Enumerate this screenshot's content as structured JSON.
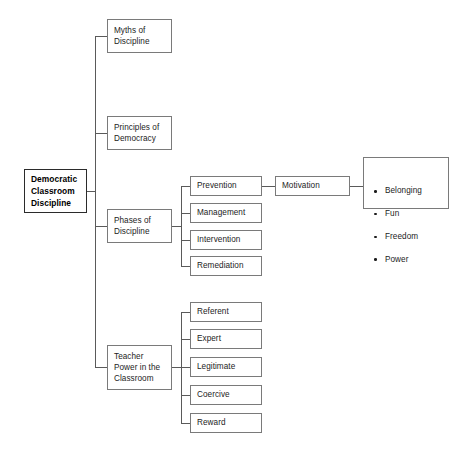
{
  "diagram": {
    "title": "Democratic Classroom Discipline",
    "type": "tree-concept-map",
    "colors": {
      "background": "#ffffff",
      "box_border": "#7a7a7a",
      "root_border": "#2b2b2b",
      "connector": "#5a5a5a",
      "text": "#1c1c1c"
    },
    "root": {
      "label": "Democratic\nClassroom\nDiscipline"
    },
    "branches": [
      {
        "label": "Myths of\nDiscipline"
      },
      {
        "label": "Principles of\nDemocracy"
      },
      {
        "label": "Phases of\nDiscipline"
      },
      {
        "label": "Teacher\nPower in the\nClassroom"
      }
    ],
    "phases": [
      {
        "label": "Prevention"
      },
      {
        "label": "Management"
      },
      {
        "label": "Intervention"
      },
      {
        "label": "Remediation"
      }
    ],
    "motivation": {
      "label": "Motivation",
      "needs": [
        "Belonging",
        "Fun",
        "Freedom",
        "Power"
      ]
    },
    "teacher_power": [
      {
        "label": "Referent"
      },
      {
        "label": "Expert"
      },
      {
        "label": "Legitimate"
      },
      {
        "label": "Coercive"
      },
      {
        "label": "Reward"
      }
    ]
  }
}
